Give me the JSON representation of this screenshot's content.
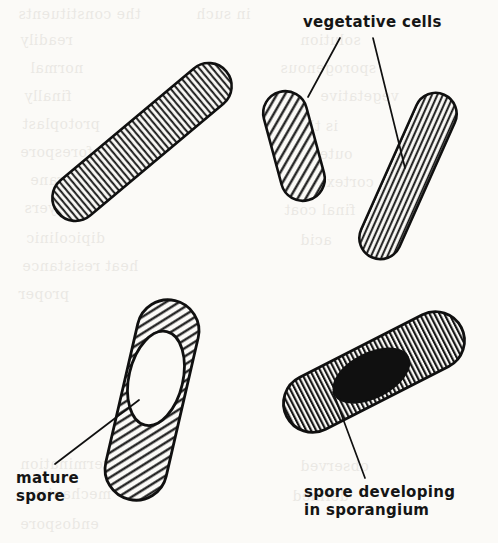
{
  "figure": {
    "kind": "scientific-line-drawing",
    "ink_color": "#101010",
    "paper_color": "#fbfaf7"
  },
  "labels": {
    "vegetative_cells": "vegetative cells",
    "mature_spore_line1": "mature",
    "mature_spore_line2": "spore",
    "sporangium_line1": "spore developing",
    "sporangium_line2": "in sporangium"
  },
  "cells": [
    {
      "id": "large-vegetative-rod",
      "name": "large vegetative rod cell",
      "fill": "vertical-hatch",
      "angle_deg": -40,
      "length": 220,
      "width": 46,
      "center_x": 142,
      "center_y": 142,
      "inclusion": "none"
    },
    {
      "id": "small-vegetative-cell",
      "name": "small vegetative cell",
      "fill": "diagonal-hatch",
      "angle_deg": -15,
      "length": 112,
      "width": 44,
      "center_x": 294,
      "center_y": 146,
      "inclusion": "none"
    },
    {
      "id": "tilted-vegetative-rod",
      "name": "tilted vegetative rod cell",
      "fill": "horizontal-hatch",
      "angle_deg": 24,
      "length": 178,
      "width": 42,
      "center_x": 408,
      "center_y": 176,
      "inclusion": "none"
    },
    {
      "id": "mature-spore-cell",
      "name": "cell containing mature spore",
      "fill": "diagonal-hatch",
      "angle_deg": 13,
      "length": 204,
      "width": 62,
      "center_x": 152,
      "center_y": 400,
      "inclusion": "white-oval",
      "inclusion_label": "mature spore"
    },
    {
      "id": "sporangium-cell",
      "name": "sporangium containing developing spore",
      "fill": "vertical-hatch",
      "angle_deg": -27,
      "length": 196,
      "width": 58,
      "center_x": 374,
      "center_y": 372,
      "inclusion": "black-oval",
      "inclusion_label": "spore developing in sporangium"
    }
  ],
  "leader_lines": [
    {
      "id": "leader-veg-left",
      "from_x": 340,
      "from_y": 38,
      "to_x": 308,
      "to_y": 97
    },
    {
      "id": "leader-veg-right",
      "from_x": 373,
      "from_y": 38,
      "to_x": 405,
      "to_y": 168
    },
    {
      "id": "leader-mature-spore",
      "from_x": 55,
      "from_y": 464,
      "to_x": 139,
      "to_y": 400
    },
    {
      "id": "leader-sporangium",
      "from_x": 365,
      "from_y": 478,
      "to_x": 333,
      "to_y": 392
    }
  ],
  "bleed_through": [
    {
      "text": "the constituents",
      "x": 18,
      "y": 6,
      "size": 14
    },
    {
      "text": "in such",
      "x": 196,
      "y": 6,
      "size": 14
    },
    {
      "text": "readily",
      "x": 20,
      "y": 32,
      "size": 14
    },
    {
      "text": "solution",
      "x": 300,
      "y": 32,
      "size": 14
    },
    {
      "text": "normal",
      "x": 30,
      "y": 60,
      "size": 14
    },
    {
      "text": "sporogenous",
      "x": 280,
      "y": 60,
      "size": 14
    },
    {
      "text": "finally",
      "x": 24,
      "y": 88,
      "size": 14
    },
    {
      "text": "vegetative",
      "x": 320,
      "y": 88,
      "size": 14
    },
    {
      "text": "protoplast",
      "x": 22,
      "y": 116,
      "size": 14
    },
    {
      "text": "is the",
      "x": 296,
      "y": 118,
      "size": 14
    },
    {
      "text": "forespore",
      "x": 20,
      "y": 144,
      "size": 14
    },
    {
      "text": "outer",
      "x": 312,
      "y": 146,
      "size": 14
    },
    {
      "text": "membrane",
      "x": 30,
      "y": 172,
      "size": 14
    },
    {
      "text": "cortex",
      "x": 326,
      "y": 174,
      "size": 14
    },
    {
      "text": "layers",
      "x": 24,
      "y": 200,
      "size": 14
    },
    {
      "text": "final coat",
      "x": 284,
      "y": 202,
      "size": 14
    },
    {
      "text": "dipicolinic",
      "x": 26,
      "y": 230,
      "size": 14
    },
    {
      "text": "acid",
      "x": 300,
      "y": 232,
      "size": 14
    },
    {
      "text": "heat resistance",
      "x": 22,
      "y": 258,
      "size": 14
    },
    {
      "text": "proper",
      "x": 18,
      "y": 286,
      "size": 14
    },
    {
      "text": "germination",
      "x": 20,
      "y": 456,
      "size": 14
    },
    {
      "text": "observed",
      "x": 300,
      "y": 458,
      "size": 14
    },
    {
      "text": "mechanism",
      "x": 26,
      "y": 486,
      "size": 14
    },
    {
      "text": "defined",
      "x": 292,
      "y": 488,
      "size": 14
    },
    {
      "text": "endospore",
      "x": 20,
      "y": 516,
      "size": 14
    }
  ]
}
